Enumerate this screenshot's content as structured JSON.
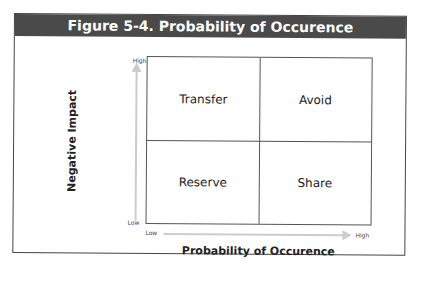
{
  "title": "Figure 5-4. Probability of Occurence",
  "quadrants": {
    "top_left": "Transfer",
    "top_right": "Avoid",
    "bottom_left": "Reserve",
    "bottom_right": "Share"
  },
  "y_axis": {
    "label": "Negative Impact",
    "high": "High",
    "low": "Low"
  },
  "x_axis": {
    "label": "Probability of Occurence",
    "low": "Low",
    "high": "High"
  },
  "colors": {
    "header_bg": "#4a4a4a",
    "arrow": "#cccccc",
    "border": "#555555"
  }
}
